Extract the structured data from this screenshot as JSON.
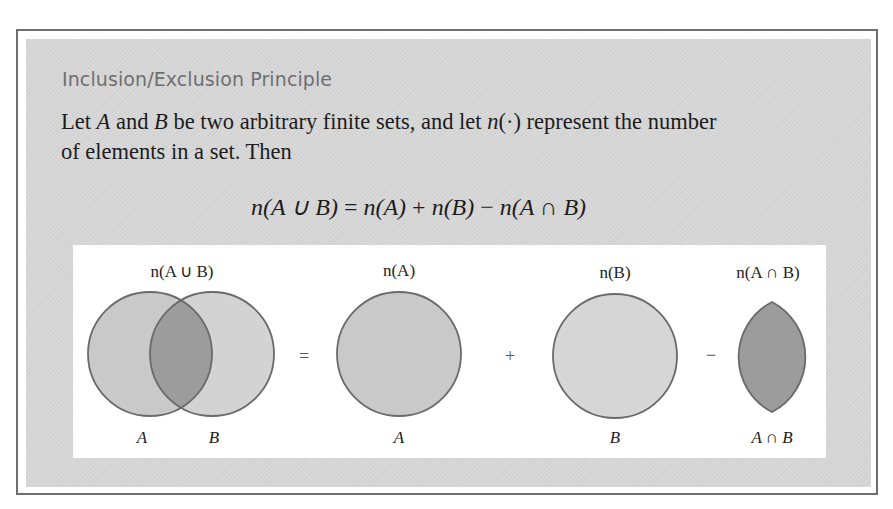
{
  "box": {
    "heading": "Inclusion/Exclusion Principle",
    "paragraph": {
      "line1_pre": "Let ",
      "var_a": "A",
      "line1_mid1": " and ",
      "var_b": "B",
      "line1_mid2": " be two arbitrary finite sets, and let ",
      "n_symbol": "n",
      "line1_dot": "(·)",
      "line1_post": " represent the number",
      "line2": "of elements in a set. Then"
    },
    "formula": {
      "lhs_n": "n",
      "lhs_args": "(A ∪ B)",
      "eq": " = ",
      "t1_n": "n",
      "t1_args": "(A)",
      "plus": " + ",
      "t2_n": "n",
      "t2_args": "(B)",
      "minus": " − ",
      "t3_n": "n",
      "t3_args": "(A ∩ B)"
    }
  },
  "diagram": {
    "colors": {
      "circle_a_fill": "#c9c9c9",
      "circle_b_fill": "#d6d6d6",
      "intersection_fill": "#9c9c9c",
      "stroke": "#6a6a6a"
    },
    "panels": [
      {
        "top_label": "n(A ∪ B)",
        "bottom_labels": [
          "A",
          "B"
        ]
      },
      {
        "top_label": "n(A)",
        "bottom_labels": [
          "A"
        ]
      },
      {
        "top_label": "n(B)",
        "bottom_labels": [
          "B"
        ]
      },
      {
        "top_label": "n(A ∩ B)",
        "bottom_labels": [
          "A ∩ B"
        ]
      }
    ],
    "operators": [
      "=",
      "+",
      "−"
    ]
  }
}
